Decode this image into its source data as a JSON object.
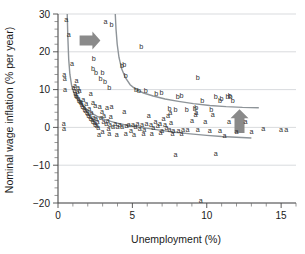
{
  "chart_data": {
    "type": "scatter",
    "title": "",
    "xlabel": "Unemployment (%)",
    "ylabel": "Nominal wage inflation (% per year)",
    "xlim": [
      0,
      16
    ],
    "ylim": [
      -20,
      30
    ],
    "xticks": [
      0,
      5,
      10,
      15
    ],
    "xtick_labels": [
      "0",
      "5",
      "10",
      "15"
    ],
    "xminor_step": 1,
    "yticks": [
      -20,
      -10,
      0,
      10,
      20,
      30
    ],
    "ytick_labels": [
      "−20",
      "−10",
      "0",
      "10",
      "20",
      "30"
    ],
    "yminor_step": 2,
    "grid": "horizontal",
    "legend": "none",
    "marker_style": "text-glyph",
    "series": [
      {
        "name": "a",
        "glyph": "a",
        "color": "#303030",
        "points": [
          [
            0.55,
            28.0
          ],
          [
            0.72,
            24.0
          ],
          [
            0.95,
            16.2
          ],
          [
            0.42,
            13.3
          ],
          [
            0.45,
            12.3
          ],
          [
            0.48,
            9.4
          ],
          [
            1.05,
            9.8
          ],
          [
            1.12,
            9.0
          ],
          [
            1.18,
            8.4
          ],
          [
            1.22,
            7.9
          ],
          [
            1.28,
            7.4
          ],
          [
            1.32,
            8.8
          ],
          [
            1.38,
            7.0
          ],
          [
            1.42,
            6.6
          ],
          [
            1.45,
            9.2
          ],
          [
            1.5,
            6.2
          ],
          [
            1.55,
            5.9
          ],
          [
            1.6,
            5.4
          ],
          [
            1.65,
            5.0
          ],
          [
            1.7,
            6.8
          ],
          [
            1.75,
            4.6
          ],
          [
            1.8,
            4.2
          ],
          [
            1.85,
            3.8
          ],
          [
            1.9,
            5.6
          ],
          [
            1.95,
            3.4
          ],
          [
            2.0,
            3.0
          ],
          [
            2.05,
            2.6
          ],
          [
            2.1,
            4.4
          ],
          [
            2.15,
            2.2
          ],
          [
            2.2,
            1.8
          ],
          [
            2.25,
            3.2
          ],
          [
            2.3,
            1.4
          ],
          [
            2.35,
            1.0
          ],
          [
            2.4,
            2.0
          ],
          [
            2.45,
            0.6
          ],
          [
            2.5,
            0.2
          ],
          [
            2.55,
            1.6
          ],
          [
            2.6,
            -0.2
          ],
          [
            2.65,
            0.9
          ],
          [
            2.7,
            -0.6
          ],
          [
            2.8,
            4.9
          ],
          [
            2.95,
            3.6
          ],
          [
            3.1,
            2.5
          ],
          [
            3.2,
            27.5
          ],
          [
            3.25,
            0.4
          ],
          [
            3.35,
            1.2
          ],
          [
            3.4,
            -1.0
          ],
          [
            3.5,
            0.1
          ],
          [
            3.6,
            5.0
          ],
          [
            3.7,
            -0.3
          ],
          [
            3.85,
            0.3
          ],
          [
            4.0,
            -0.4
          ],
          [
            4.15,
            0.0
          ],
          [
            4.3,
            -0.5
          ],
          [
            4.45,
            3.6
          ],
          [
            4.6,
            -0.2
          ],
          [
            4.75,
            0.2
          ],
          [
            4.9,
            -1.6
          ],
          [
            5.05,
            0.1
          ],
          [
            5.2,
            -0.3
          ],
          [
            5.35,
            0.4
          ],
          [
            5.5,
            -0.9
          ],
          [
            5.65,
            0.0
          ],
          [
            5.8,
            -1.2
          ],
          [
            5.95,
            0.5
          ],
          [
            6.1,
            2.4
          ],
          [
            6.25,
            0.1
          ],
          [
            6.4,
            -0.6
          ],
          [
            6.55,
            1.0
          ],
          [
            6.7,
            -0.2
          ],
          [
            6.85,
            0.3
          ],
          [
            7.0,
            -1.4
          ],
          [
            7.1,
            1.8
          ],
          [
            7.2,
            0.2
          ],
          [
            7.3,
            -0.7
          ],
          [
            7.4,
            2.6
          ],
          [
            7.5,
            -1.1
          ],
          [
            7.55,
            3.2
          ],
          [
            7.6,
            0.6
          ],
          [
            7.75,
            -1.5
          ],
          [
            7.9,
            -7.8
          ],
          [
            8.1,
            -1.4
          ],
          [
            8.4,
            -1.3
          ],
          [
            8.7,
            -1.2
          ],
          [
            9.0,
            1.1
          ],
          [
            9.25,
            2.8
          ],
          [
            9.3,
            3.4
          ],
          [
            9.4,
            -1.3
          ],
          [
            9.6,
            -20.0
          ],
          [
            9.9,
            1.0
          ],
          [
            10.2,
            -1.5
          ],
          [
            10.4,
            2.8
          ],
          [
            10.6,
            -7.6
          ],
          [
            10.9,
            -1.6
          ],
          [
            11.2,
            -2.8
          ],
          [
            11.5,
            0.9
          ],
          [
            12.0,
            -1.7
          ],
          [
            12.6,
            1.0
          ],
          [
            13.0,
            -1.8
          ],
          [
            13.8,
            -1.0
          ],
          [
            15.0,
            -1.2
          ],
          [
            15.35,
            -1.2
          ],
          [
            0.38,
            0.4
          ],
          [
            0.4,
            -0.9
          ],
          [
            1.15,
            10.4
          ],
          [
            1.35,
            10.0
          ],
          [
            2.75,
            -2.6
          ],
          [
            3.0,
            -1.7
          ],
          [
            3.45,
            -2.3
          ],
          [
            3.95,
            -2.5
          ],
          [
            4.55,
            -2.2
          ],
          [
            5.1,
            -2.4
          ],
          [
            5.75,
            -2.2
          ],
          [
            6.3,
            -2.3
          ],
          [
            6.9,
            -2.1
          ],
          [
            7.7,
            -2.3
          ],
          [
            8.3,
            -2.2
          ],
          [
            2.2,
            8.2
          ],
          [
            2.35,
            6.0
          ],
          [
            2.5,
            5.2
          ],
          [
            2.9,
            1.9
          ],
          [
            3.05,
            0.8
          ],
          [
            3.3,
            4.7
          ],
          [
            3.55,
            2.2
          ],
          [
            1.25,
            11.8
          ]
        ]
      },
      {
        "name": "b",
        "glyph": "b",
        "color": "#303030",
        "points": [
          [
            3.6,
            26.5
          ],
          [
            2.4,
            17.6
          ],
          [
            2.35,
            15.0
          ],
          [
            2.55,
            13.9
          ],
          [
            3.0,
            14.0
          ],
          [
            2.85,
            12.2
          ],
          [
            3.15,
            11.6
          ],
          [
            3.45,
            9.9
          ],
          [
            4.3,
            15.8
          ],
          [
            4.45,
            16.0
          ],
          [
            4.55,
            13.2
          ],
          [
            5.25,
            9.3
          ],
          [
            5.45,
            9.0
          ],
          [
            5.6,
            20.8
          ],
          [
            5.9,
            9.2
          ],
          [
            6.6,
            8.4
          ],
          [
            6.95,
            8.7
          ],
          [
            7.5,
            4.3
          ],
          [
            7.9,
            4.2
          ],
          [
            8.05,
            7.6
          ],
          [
            8.3,
            7.9
          ],
          [
            8.65,
            4.0
          ],
          [
            9.2,
            4.4
          ],
          [
            9.3,
            4.6
          ],
          [
            9.4,
            12.6
          ],
          [
            9.7,
            6.6
          ],
          [
            10.3,
            4.0
          ],
          [
            10.6,
            7.5
          ],
          [
            11.0,
            6.9
          ],
          [
            11.4,
            7.6
          ],
          [
            11.55,
            7.9
          ],
          [
            11.6,
            7.5
          ],
          [
            11.75,
            6.4
          ],
          [
            10.9,
            6.6
          ]
        ]
      }
    ],
    "curves": [
      {
        "name": "lower-phillips-curve",
        "color": "#8e9499",
        "points": [
          [
            0.62,
            30.0
          ],
          [
            0.66,
            24.0
          ],
          [
            0.72,
            18.0
          ],
          [
            0.8,
            14.0
          ],
          [
            0.92,
            11.0
          ],
          [
            1.1,
            8.8
          ],
          [
            1.35,
            7.2
          ],
          [
            1.7,
            5.6
          ],
          [
            2.1,
            4.2
          ],
          [
            2.6,
            3.0
          ],
          [
            3.2,
            2.0
          ],
          [
            3.9,
            1.2
          ],
          [
            4.7,
            0.5
          ],
          [
            5.6,
            0.0
          ],
          [
            6.6,
            -0.6
          ],
          [
            7.7,
            -1.2
          ],
          [
            8.9,
            -1.7
          ],
          [
            10.0,
            -2.1
          ],
          [
            11.0,
            -2.4
          ],
          [
            12.0,
            -2.6
          ],
          [
            13.0,
            -2.8
          ]
        ]
      },
      {
        "name": "upper-phillips-curve",
        "color": "#8e9499",
        "points": [
          [
            3.85,
            30.0
          ],
          [
            3.9,
            26.0
          ],
          [
            3.98,
            22.0
          ],
          [
            4.1,
            18.5
          ],
          [
            4.28,
            15.5
          ],
          [
            4.52,
            13.2
          ],
          [
            4.85,
            11.3
          ],
          [
            5.25,
            10.0
          ],
          [
            5.75,
            9.1
          ],
          [
            6.4,
            8.3
          ],
          [
            7.2,
            7.5
          ],
          [
            8.1,
            6.9
          ],
          [
            9.1,
            6.3
          ],
          [
            10.2,
            5.8
          ],
          [
            11.3,
            5.5
          ],
          [
            12.4,
            5.3
          ],
          [
            13.5,
            5.2
          ]
        ]
      }
    ],
    "annotations": [
      {
        "name": "horizontal-shift-arrow",
        "type": "arrow",
        "direction": "right",
        "color": "#8a8a8a",
        "x_start": 1.45,
        "x_end": 2.85,
        "y": 23.0
      },
      {
        "name": "vertical-shift-arrow",
        "type": "arrow",
        "direction": "up",
        "color": "#8a8a8a",
        "x": 12.2,
        "y_start": -1.5,
        "y_end": 4.8
      }
    ]
  }
}
